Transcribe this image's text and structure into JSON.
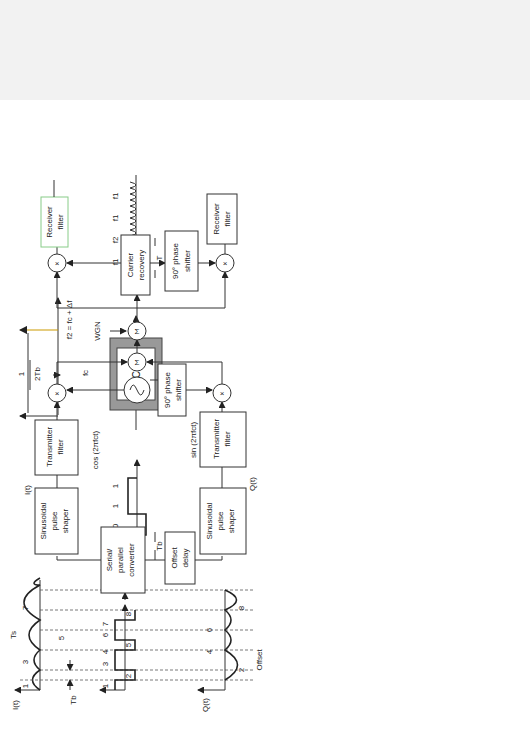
{
  "diagram": {
    "part_a": {
      "label": "(a)",
      "bit_sequence": [
        "1",
        "0",
        "1",
        "1"
      ],
      "bit_period_label": "Tb",
      "freq_labels": {
        "f1": "f1 = fc − Δf",
        "fc": "fc",
        "f2": "f2 = fc + Δf",
        "spacing_num": "1",
        "spacing_den": "2Tb"
      },
      "vco_label": "VCO",
      "fsk_segments": [
        "f1",
        "f2",
        "f1",
        "f1"
      ],
      "symbol_period_label": "T"
    },
    "part_b": {
      "label": "(b)",
      "sections": {
        "transmitter": "Transmitter",
        "channel_line1": "Transmission",
        "channel_line2": "channel",
        "receiver": "Receiver"
      },
      "input_waveforms": {
        "i_label": "I(t)",
        "i_numbers": [
          "1",
          "3",
          "5",
          "7"
        ],
        "ts_label": "Ts",
        "tb_label": "Tb",
        "bits_numbers": [
          "1",
          "2",
          "3",
          "4",
          "5",
          "6",
          "7",
          "8"
        ],
        "q_label": "Q(t)",
        "q_numbers": [
          "2",
          "4",
          "6",
          "8"
        ],
        "offset_label": "Offset"
      },
      "transmitter_blocks": {
        "serial_parallel": [
          "Serial/",
          "parallel",
          "converter"
        ],
        "offset_delay": [
          "Offset",
          "delay"
        ],
        "pulse_shaper_i": [
          "Sinusoidal",
          "pulse",
          "shaper"
        ],
        "pulse_shaper_q": [
          "Sinusoidal",
          "pulse",
          "shaper"
        ],
        "tx_filter_i": [
          "Transmitter",
          "filter"
        ],
        "tx_filter_q": [
          "Transmitter",
          "filter"
        ],
        "i_signal": "I(t)",
        "q_signal": "Q(t)",
        "cos_label": "cos (2πfct)",
        "sin_label": "sin (2πfct)",
        "phase_shifter": [
          "90° phase",
          "shifter"
        ],
        "multiplier": "×",
        "summer": "Σ",
        "wgn": "WGN"
      },
      "receiver_blocks": {
        "carrier_recovery": [
          "Carrier",
          "recovery"
        ],
        "phase_shifter": [
          "90° phase",
          "shifter"
        ],
        "rx_filter_i": [
          "Receiver",
          "filter"
        ],
        "rx_filter_q": [
          "Receiver",
          "filter"
        ],
        "decision_i": [
          "Decision",
          "threshold"
        ],
        "decision_q": [
          "Decision",
          "threshold"
        ],
        "symbol_timing": [
          "Symbol",
          "timing",
          "recovery"
        ],
        "offset_delay": [
          "Offset",
          "delay"
        ],
        "parallel_serial": [
          "Parallel/serial",
          "converter"
        ],
        "output": [
          "Output",
          "data"
        ]
      }
    }
  }
}
